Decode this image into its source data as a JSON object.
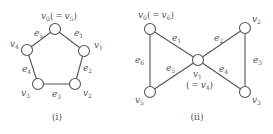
{
  "figures": [
    {
      "id": "i",
      "caption": "(i)",
      "caption_pos": [
        57,
        120
      ],
      "node_radius": 5.5,
      "nodes": [
        {
          "name": "v0",
          "letter": "v",
          "sub": "0",
          "alias_letter": "v",
          "alias_sub": "5",
          "x": 55,
          "y": 29,
          "label_x": 41,
          "label_y": 19
        },
        {
          "name": "v1",
          "letter": "v",
          "sub": "1",
          "x": 84,
          "y": 51,
          "label_x": 94,
          "label_y": 48
        },
        {
          "name": "v2",
          "letter": "v",
          "sub": "2",
          "x": 75,
          "y": 84,
          "label_x": 83,
          "label_y": 96
        },
        {
          "name": "v3",
          "letter": "v",
          "sub": "3",
          "x": 38,
          "y": 84,
          "label_x": 21,
          "label_y": 96
        },
        {
          "name": "v4",
          "letter": "v",
          "sub": "4",
          "x": 27,
          "y": 50,
          "label_x": 10,
          "label_y": 47
        }
      ],
      "edges": [
        {
          "name": "e1",
          "from": 0,
          "to": 1,
          "letter": "e",
          "sub": "1",
          "label_x": 74,
          "label_y": 36
        },
        {
          "name": "e2",
          "from": 1,
          "to": 2,
          "letter": "e",
          "sub": "2",
          "label_x": 83,
          "label_y": 71
        },
        {
          "name": "e3",
          "from": 2,
          "to": 3,
          "letter": "e",
          "sub": "3",
          "label_x": 52,
          "label_y": 97
        },
        {
          "name": "e4",
          "from": 3,
          "to": 4,
          "letter": "e",
          "sub": "4",
          "label_x": 22,
          "label_y": 72
        },
        {
          "name": "e5",
          "from": 4,
          "to": 0,
          "letter": "e",
          "sub": "5",
          "label_x": 34,
          "label_y": 36
        }
      ]
    },
    {
      "id": "ii",
      "caption": "(ii)",
      "caption_pos": [
        197,
        120
      ],
      "node_radius": 5.5,
      "nodes": [
        {
          "name": "v0",
          "letter": "v",
          "sub": "0",
          "alias_letter": "v",
          "alias_sub": "6",
          "x": 150,
          "y": 29,
          "label_x": 138,
          "label_y": 18
        },
        {
          "name": "v1",
          "letter": "v",
          "sub": "1",
          "alias_letter": "v",
          "alias_sub": "4",
          "x": 198,
          "y": 60,
          "label_x": 193,
          "label_y": 77,
          "alias_below": true,
          "alias_x": 186,
          "alias_y": 88
        },
        {
          "name": "v2",
          "letter": "v",
          "sub": "2",
          "x": 245,
          "y": 28,
          "label_x": 252,
          "label_y": 22
        },
        {
          "name": "v3",
          "letter": "v",
          "sub": "3",
          "x": 245,
          "y": 92,
          "label_x": 252,
          "label_y": 103
        },
        {
          "name": "v5",
          "letter": "v",
          "sub": "5",
          "x": 150,
          "y": 92,
          "label_x": 135,
          "label_y": 103
        }
      ],
      "edges": [
        {
          "name": "e1",
          "from": 0,
          "to": 1,
          "letter": "e",
          "sub": "1",
          "label_x": 172,
          "label_y": 41
        },
        {
          "name": "e2",
          "from": 1,
          "to": 2,
          "letter": "e",
          "sub": "2",
          "label_x": 214,
          "label_y": 41
        },
        {
          "name": "e3",
          "from": 2,
          "to": 3,
          "letter": "e",
          "sub": "3",
          "label_x": 253,
          "label_y": 63
        },
        {
          "name": "e4",
          "from": 1,
          "to": 3,
          "letter": "e",
          "sub": "4",
          "label_x": 219,
          "label_y": 72
        },
        {
          "name": "e5",
          "from": 1,
          "to": 4,
          "letter": "e",
          "sub": "5",
          "label_x": 166,
          "label_y": 71
        },
        {
          "name": "e6",
          "from": 4,
          "to": 0,
          "letter": "e",
          "sub": "6",
          "label_x": 135,
          "label_y": 63
        }
      ]
    }
  ],
  "colors": {
    "stroke": "#555555",
    "text": "#555555",
    "background": "#ffffff"
  }
}
